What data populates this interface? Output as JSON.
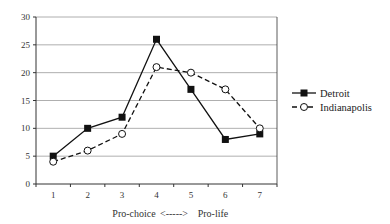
{
  "chart_data": {
    "type": "line",
    "title": "",
    "xlabel": "Pro-choice   <----->   Pro-life",
    "xlabel_parts": [
      "Pro-choice",
      "<----->",
      "Pro-life"
    ],
    "ylabel": "",
    "categories": [
      "1",
      "2",
      "3",
      "4",
      "5",
      "6",
      "7"
    ],
    "yticks": [
      0,
      5,
      10,
      15,
      20,
      25,
      30
    ],
    "ylim": [
      0,
      30
    ],
    "grid": true,
    "legend_position": "right",
    "series": [
      {
        "name": "Detroit",
        "marker": "filled-square",
        "line": "solid",
        "values": [
          5,
          10,
          12,
          26,
          17,
          8,
          9
        ]
      },
      {
        "name": "Indianapolis",
        "marker": "open-circle",
        "line": "dashed",
        "values": [
          4,
          6,
          9,
          21,
          20,
          17,
          10
        ]
      }
    ]
  },
  "colors": {
    "line": "#111111",
    "grid": "#9a9a9a",
    "axis": "#333333",
    "background": "#ffffff"
  }
}
